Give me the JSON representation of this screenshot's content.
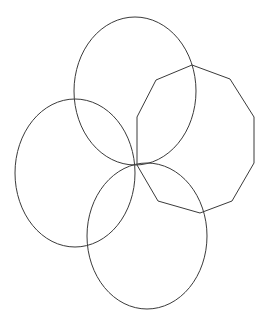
{
  "diagram": {
    "background": "#ffffff",
    "stroke_color": "#3a3a3a",
    "shapes": [
      {
        "type": "ellipse",
        "name": "top-circle",
        "cx": 135,
        "cy": 91,
        "rx": 61,
        "ry": 74
      },
      {
        "type": "ellipse",
        "name": "left-circle",
        "cx": 75,
        "cy": 173,
        "rx": 60,
        "ry": 74
      },
      {
        "type": "ellipse",
        "name": "bottom-circle",
        "cx": 147,
        "cy": 236,
        "rx": 60,
        "ry": 73
      },
      {
        "type": "polygon",
        "name": "decagon",
        "points": "192,65 230,79 254,117 254,163 232,201 200,213 158,201 137,165 137,117 156,80"
      }
    ]
  }
}
